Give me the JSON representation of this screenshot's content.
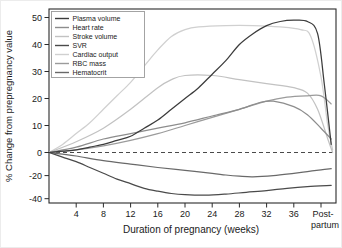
{
  "chart_data": {
    "type": "line",
    "title": "",
    "xlabel": "Duration of pregnancy (weeks)",
    "ylabel": "% Change from prepregnancy value",
    "x_axis": {
      "tick_labels": [
        "4",
        "8",
        "12",
        "16",
        "20",
        "24",
        "28",
        "32",
        "36"
      ],
      "tick_weeks": [
        4,
        8,
        12,
        16,
        20,
        24,
        28,
        32,
        36
      ],
      "postpartum_tick": {
        "week": 40,
        "line1": "Post-",
        "line2": "partum"
      },
      "range_weeks": [
        0,
        42.2
      ]
    },
    "y_axis": {
      "tick_values": [
        50,
        40,
        30,
        20,
        10,
        0,
        -20,
        -40
      ],
      "tick_labels": [
        "50",
        "40",
        "30",
        "20",
        "10",
        "0",
        "-20",
        "-40"
      ],
      "range": [
        -44,
        53
      ],
      "note": "negative region compressed relative to positive region",
      "grid": false
    },
    "zero_line": {
      "value": 0,
      "style": "dashed",
      "color": "#4a4a4a"
    },
    "legend": {
      "position": "top-left",
      "entries": [
        "Plasma volume",
        "Heart rate",
        "Stroke volume",
        "SVR",
        "Cardiac output",
        "RBC mass",
        "Hematocrit"
      ]
    },
    "series": [
      {
        "id": "cardiac-output",
        "name": "Cardiac output",
        "color": "#d0d0d0",
        "points": [
          [
            0,
            0
          ],
          [
            2,
            3
          ],
          [
            4,
            7
          ],
          [
            6,
            11
          ],
          [
            8,
            16
          ],
          [
            10,
            21
          ],
          [
            12,
            26
          ],
          [
            14,
            32
          ],
          [
            16,
            38
          ],
          [
            18,
            43
          ],
          [
            20,
            45.5
          ],
          [
            22,
            46.5
          ],
          [
            26,
            47
          ],
          [
            30,
            47
          ],
          [
            34,
            46.5
          ],
          [
            37,
            45.5
          ],
          [
            38.5,
            43
          ],
          [
            40,
            28
          ],
          [
            41,
            10
          ],
          [
            41.7,
            1
          ]
        ]
      },
      {
        "id": "stroke-volume",
        "name": "Stroke volume",
        "color": "#c2c2c2",
        "points": [
          [
            0,
            0
          ],
          [
            4,
            4
          ],
          [
            8,
            9
          ],
          [
            12,
            16
          ],
          [
            16,
            24
          ],
          [
            18,
            27
          ],
          [
            20,
            28.5
          ],
          [
            24,
            28.5
          ],
          [
            28,
            27
          ],
          [
            32,
            25.5
          ],
          [
            36,
            24
          ],
          [
            38,
            22
          ],
          [
            39.5,
            16
          ],
          [
            41,
            5
          ],
          [
            41.7,
            0
          ]
        ]
      },
      {
        "id": "rbc-mass",
        "name": "RBC mass",
        "color": "#9b9b9b",
        "points": [
          [
            0,
            0
          ],
          [
            4,
            1
          ],
          [
            8,
            2.5
          ],
          [
            12,
            4.5
          ],
          [
            16,
            7
          ],
          [
            20,
            10
          ],
          [
            24,
            13
          ],
          [
            28,
            16
          ],
          [
            32,
            19
          ],
          [
            35,
            20.5
          ],
          [
            38,
            21
          ],
          [
            40,
            21
          ],
          [
            41.5,
            18
          ]
        ]
      },
      {
        "id": "heart-rate",
        "name": "Heart rate",
        "color": "#8d8d8d",
        "points": [
          [
            0,
            0
          ],
          [
            4,
            2
          ],
          [
            8,
            5
          ],
          [
            12,
            7
          ],
          [
            16,
            9
          ],
          [
            20,
            11
          ],
          [
            24,
            13.5
          ],
          [
            28,
            16
          ],
          [
            31,
            18.5
          ],
          [
            33,
            19
          ],
          [
            36,
            17
          ],
          [
            38,
            14
          ],
          [
            40,
            9
          ],
          [
            41.5,
            5
          ]
        ]
      },
      {
        "id": "hematocrit",
        "name": "Hematocrit",
        "color": "#696969",
        "points": [
          [
            0,
            0
          ],
          [
            2,
            -1.5
          ],
          [
            4,
            -3
          ],
          [
            8,
            -7
          ],
          [
            12,
            -10
          ],
          [
            16,
            -13
          ],
          [
            20,
            -15.5
          ],
          [
            24,
            -18
          ],
          [
            26,
            -19.5
          ],
          [
            28,
            -20.5
          ],
          [
            30,
            -21
          ],
          [
            33,
            -20
          ],
          [
            36,
            -18
          ],
          [
            38,
            -16.5
          ],
          [
            40,
            -15
          ],
          [
            41.5,
            -14
          ]
        ]
      },
      {
        "id": "svr",
        "name": "SVR",
        "color": "#4a4a4a",
        "points": [
          [
            0,
            0
          ],
          [
            2,
            -4
          ],
          [
            4,
            -8
          ],
          [
            6,
            -13
          ],
          [
            8,
            -18
          ],
          [
            10,
            -23
          ],
          [
            12,
            -27
          ],
          [
            14,
            -31
          ],
          [
            16,
            -33.5
          ],
          [
            18,
            -35.5
          ],
          [
            20,
            -36.5
          ],
          [
            23,
            -37
          ],
          [
            26,
            -36
          ],
          [
            29,
            -34.5
          ],
          [
            32,
            -33
          ],
          [
            35,
            -31
          ],
          [
            38,
            -29.5
          ],
          [
            41.5,
            -28.5
          ]
        ]
      },
      {
        "id": "plasma-volume",
        "name": "Plasma volume",
        "color": "#3c3c3c",
        "points": [
          [
            0,
            0
          ],
          [
            2,
            0.5
          ],
          [
            4,
            1
          ],
          [
            6,
            2
          ],
          [
            8,
            3
          ],
          [
            10,
            4.5
          ],
          [
            12,
            6
          ],
          [
            14,
            9
          ],
          [
            16,
            12
          ],
          [
            18,
            16
          ],
          [
            20,
            20
          ],
          [
            22,
            24
          ],
          [
            24,
            29
          ],
          [
            26,
            34
          ],
          [
            28,
            40
          ],
          [
            30,
            44
          ],
          [
            32,
            47
          ],
          [
            34,
            48.5
          ],
          [
            36,
            49
          ],
          [
            38,
            48.5
          ],
          [
            39.5,
            44
          ],
          [
            40.5,
            25
          ],
          [
            41.5,
            3
          ]
        ]
      }
    ]
  }
}
